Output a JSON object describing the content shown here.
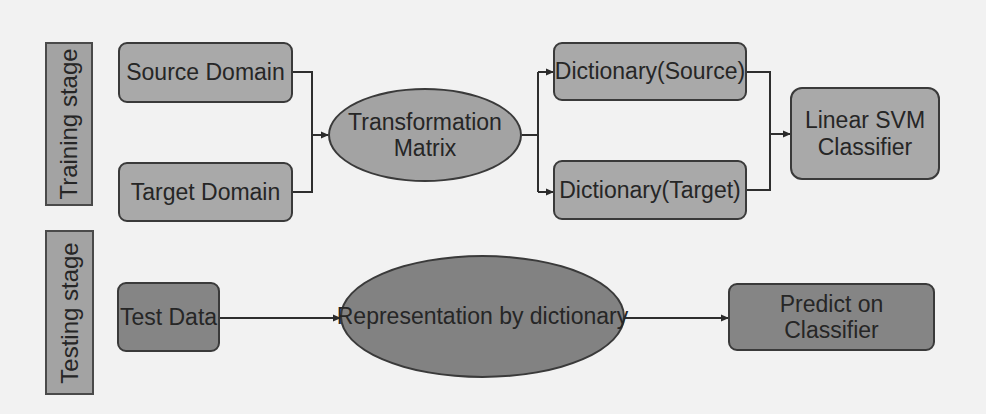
{
  "diagram": {
    "stages": {
      "training": "Training stage",
      "testing": "Testing stage"
    },
    "training_nodes": {
      "source_domain": "Source Domain",
      "target_domain": "Target Domain",
      "transformation_matrix_line1": "Transformation",
      "transformation_matrix_line2": "Matrix",
      "dictionary_source": "Dictionary(Source)",
      "dictionary_target": "Dictionary(Target)",
      "linear_svm_line1": "Linear SVM",
      "linear_svm_line2": "Classifier"
    },
    "testing_nodes": {
      "test_data": "Test Data",
      "representation": "Representation by dictionary",
      "predict": "Predict on Classifier"
    },
    "edges": [
      {
        "from": "Source Domain",
        "to": "Transformation Matrix"
      },
      {
        "from": "Target Domain",
        "to": "Transformation Matrix"
      },
      {
        "from": "Transformation Matrix",
        "to": "Dictionary(Source)"
      },
      {
        "from": "Transformation Matrix",
        "to": "Dictionary(Target)"
      },
      {
        "from": "Dictionary(Source)",
        "to": "Linear SVM Classifier"
      },
      {
        "from": "Dictionary(Target)",
        "to": "Linear SVM Classifier"
      },
      {
        "from": "Test Data",
        "to": "Representation by dictionary"
      },
      {
        "from": "Representation by dictionary",
        "to": "Predict on Classifier"
      }
    ],
    "colors": {
      "background": "#f2f2f2",
      "box_fill": "#a9a9a9",
      "box_fill_dark": "#858585",
      "stroke": "#3a3a3a",
      "text": "#262626"
    }
  }
}
